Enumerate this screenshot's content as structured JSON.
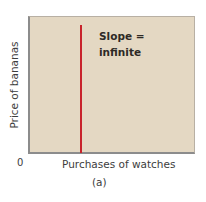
{
  "chart_data": {
    "type": "line",
    "title": "",
    "xlabel": "Purchases of watches",
    "ylabel": "Price of bananas",
    "origin_label": "0",
    "caption": "(a)",
    "annotation": [
      "Slope =",
      "infinite"
    ],
    "series": [
      {
        "name": "vertical line",
        "color": "#c8232c",
        "orientation": "vertical",
        "slope": "infinite"
      }
    ],
    "grid": false,
    "legend": null,
    "colors": {
      "plot_background": "#e4d8c3",
      "line": "#c8232c",
      "axis": "#8c8c8c"
    }
  }
}
